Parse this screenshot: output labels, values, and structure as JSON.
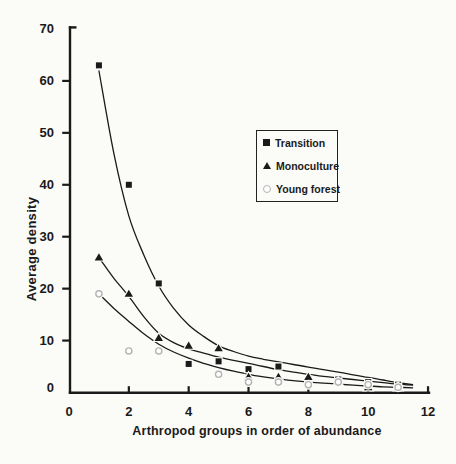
{
  "figure": {
    "width": 456,
    "height": 464,
    "background": "#fbfbf8",
    "ink": "#1a1a1a",
    "muted_marker_color": "#b4b4b4"
  },
  "chart_data": {
    "type": "scatter",
    "title": "",
    "xlabel": "Arthropod groups in order of abundance",
    "ylabel": "Average density",
    "xlim": [
      0,
      12.2
    ],
    "ylim": [
      0,
      70
    ],
    "x_ticks": [
      0,
      2,
      4,
      6,
      8,
      10,
      12
    ],
    "y_ticks": [
      0,
      10,
      20,
      30,
      40,
      50,
      60,
      70
    ],
    "grid": false,
    "legend_position": "boxed, inside upper right",
    "series": [
      {
        "name": "Transition",
        "marker": "filled-square",
        "color": "#1a1a1a",
        "x": [
          1,
          2,
          3,
          4,
          5,
          6,
          7,
          8,
          9,
          10,
          11
        ],
        "y": [
          63,
          40,
          21,
          5.5,
          6,
          4.5,
          5,
          2.5,
          2.5,
          2,
          1.5
        ]
      },
      {
        "name": "Monoculture",
        "marker": "filled-triangle",
        "color": "#1a1a1a",
        "x": [
          1,
          2,
          3,
          4,
          5,
          6,
          7,
          8,
          9,
          10,
          11
        ],
        "y": [
          26,
          19,
          10.5,
          9,
          8.5,
          3,
          3,
          3,
          2,
          1,
          1
        ]
      },
      {
        "name": "Young forest",
        "marker": "open-circle",
        "color": "#b4b4b4",
        "x": [
          1,
          2,
          3,
          5,
          6,
          7,
          8,
          9,
          10,
          11
        ],
        "y": [
          19,
          8,
          8,
          3.5,
          2,
          2,
          1.5,
          2,
          1.5,
          1
        ]
      }
    ],
    "fit_curves": [
      {
        "series": "Transition",
        "points": [
          [
            1,
            62
          ],
          [
            1.5,
            46
          ],
          [
            2,
            34
          ],
          [
            2.5,
            26.5
          ],
          [
            3,
            20.5
          ],
          [
            3.5,
            16.2
          ],
          [
            4,
            13
          ],
          [
            4.5,
            10.8
          ],
          [
            5,
            9
          ],
          [
            5.5,
            7.9
          ],
          [
            6,
            7
          ],
          [
            6.5,
            6.4
          ],
          [
            7,
            5.9
          ],
          [
            7.5,
            5.4
          ],
          [
            8,
            4.9
          ],
          [
            8.5,
            4.4
          ],
          [
            9,
            3.9
          ],
          [
            9.5,
            3.4
          ],
          [
            10,
            2.9
          ],
          [
            10.5,
            2.4
          ],
          [
            11,
            1.9
          ],
          [
            11.5,
            1.5
          ]
        ]
      },
      {
        "series": "Monoculture",
        "points": [
          [
            1,
            26
          ],
          [
            1.5,
            22
          ],
          [
            2,
            18.5
          ],
          [
            2.5,
            14.6
          ],
          [
            3,
            11.4
          ],
          [
            3.5,
            9.6
          ],
          [
            4,
            8.4
          ],
          [
            4.5,
            7.6
          ],
          [
            5,
            6.8
          ],
          [
            5.5,
            6.2
          ],
          [
            6,
            5.6
          ],
          [
            6.5,
            5.0
          ],
          [
            7,
            4.4
          ],
          [
            7.5,
            3.9
          ],
          [
            8,
            3.5
          ],
          [
            8.5,
            3.1
          ],
          [
            9,
            2.8
          ],
          [
            9.5,
            2.5
          ],
          [
            10,
            2.2
          ],
          [
            10.5,
            1.9
          ],
          [
            11,
            1.6
          ],
          [
            11.5,
            1.4
          ]
        ]
      },
      {
        "series": "Young forest",
        "points": [
          [
            1,
            19
          ],
          [
            1.5,
            16.2
          ],
          [
            2,
            13.7
          ],
          [
            2.5,
            11.3
          ],
          [
            3,
            9.3
          ],
          [
            3.5,
            7.8
          ],
          [
            4,
            6.6
          ],
          [
            4.5,
            5.6
          ],
          [
            5,
            4.8
          ],
          [
            5.5,
            4.1
          ],
          [
            6,
            3.5
          ],
          [
            6.5,
            3.0
          ],
          [
            7,
            2.6
          ],
          [
            7.5,
            2.3
          ],
          [
            8,
            2.0
          ],
          [
            8.5,
            1.8
          ],
          [
            9,
            1.6
          ],
          [
            9.5,
            1.4
          ],
          [
            10,
            1.25
          ],
          [
            10.5,
            1.1
          ],
          [
            11,
            1.0
          ],
          [
            11.5,
            0.9
          ]
        ]
      }
    ]
  },
  "legend": {
    "items": [
      {
        "label": "Transition",
        "marker": "filled-square"
      },
      {
        "label": "Monoculture",
        "marker": "filled-triangle"
      },
      {
        "label": "Young forest",
        "marker": "open-circle"
      }
    ]
  }
}
